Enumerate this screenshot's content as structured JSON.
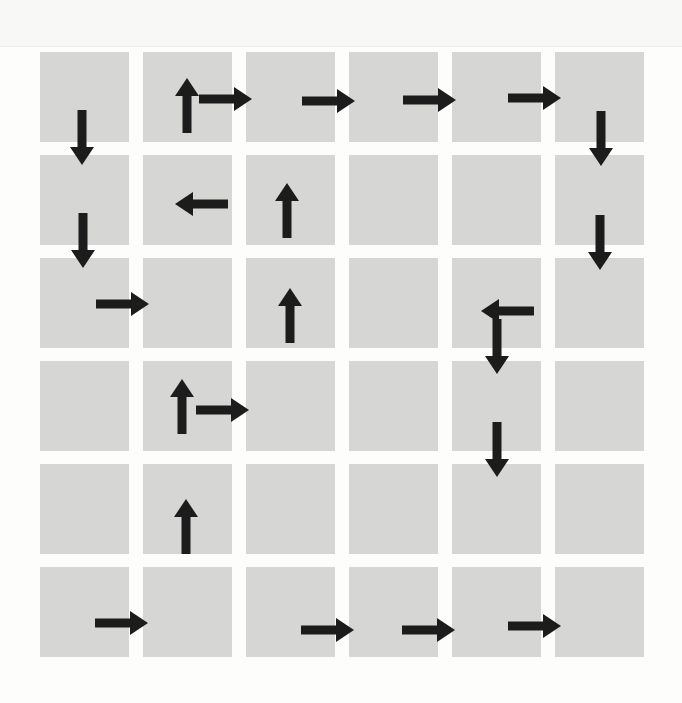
{
  "diagram": {
    "type": "grid-path",
    "rows": 6,
    "cols": 6,
    "colors": {
      "cell": "#d6d6d4",
      "arrow": "#1c1c1c",
      "background": "#fdfdfc"
    },
    "grid": {
      "col_x": [
        40,
        143,
        246,
        349,
        452,
        555
      ],
      "row_y": [
        52,
        155,
        258,
        361,
        464,
        567
      ],
      "cell_size": 89
    },
    "arrows": [
      {
        "dir": "down",
        "x": 82,
        "y": 110,
        "len": 55
      },
      {
        "dir": "down",
        "x": 83,
        "y": 213,
        "len": 55
      },
      {
        "dir": "right",
        "x": 96,
        "y": 304,
        "len": 53
      },
      {
        "dir": "up",
        "x": 187,
        "y": 133,
        "len": 55
      },
      {
        "dir": "right",
        "x": 199,
        "y": 99,
        "len": 53
      },
      {
        "dir": "right",
        "x": 302,
        "y": 101,
        "len": 53
      },
      {
        "dir": "right",
        "x": 403,
        "y": 100,
        "len": 53
      },
      {
        "dir": "right",
        "x": 508,
        "y": 98,
        "len": 53
      },
      {
        "dir": "down",
        "x": 601,
        "y": 111,
        "len": 55
      },
      {
        "dir": "down",
        "x": 600,
        "y": 215,
        "len": 55
      },
      {
        "dir": "left",
        "x": 534,
        "y": 311,
        "len": 53
      },
      {
        "dir": "down",
        "x": 497,
        "y": 319,
        "len": 55
      },
      {
        "dir": "down",
        "x": 497,
        "y": 422,
        "len": 55
      },
      {
        "dir": "left",
        "x": 228,
        "y": 204,
        "len": 53
      },
      {
        "dir": "up",
        "x": 287,
        "y": 238,
        "len": 55
      },
      {
        "dir": "up",
        "x": 290,
        "y": 343,
        "len": 55
      },
      {
        "dir": "right",
        "x": 196,
        "y": 410,
        "len": 53
      },
      {
        "dir": "up",
        "x": 182,
        "y": 434,
        "len": 55
      },
      {
        "dir": "up",
        "x": 186,
        "y": 554,
        "len": 55
      },
      {
        "dir": "right",
        "x": 95,
        "y": 623,
        "len": 53
      },
      {
        "dir": "right",
        "x": 301,
        "y": 630,
        "len": 53
      },
      {
        "dir": "right",
        "x": 402,
        "y": 630,
        "len": 53
      },
      {
        "dir": "right",
        "x": 508,
        "y": 626,
        "len": 53
      }
    ]
  }
}
